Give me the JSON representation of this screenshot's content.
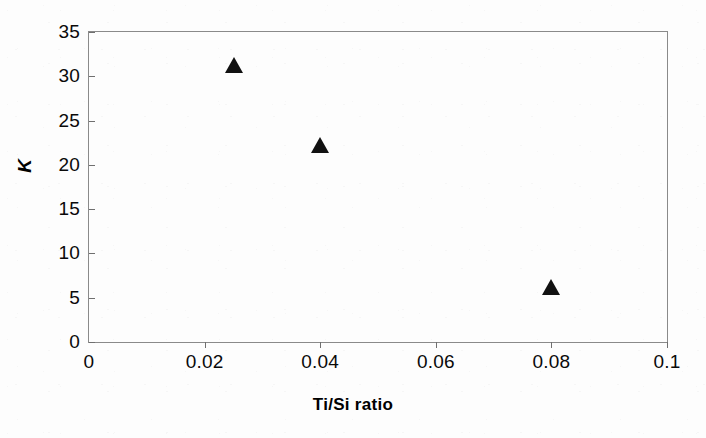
{
  "chart_data": {
    "type": "scatter",
    "title": "",
    "xlabel": "Ti/Si ratio",
    "ylabel": "K",
    "xlim": [
      0,
      0.1
    ],
    "ylim": [
      0,
      35
    ],
    "xticks": [
      "0",
      "0.02",
      "0.04",
      "0.06",
      "0.08",
      "0.1"
    ],
    "xtick_values": [
      0,
      0.02,
      0.04,
      0.06,
      0.08,
      0.1
    ],
    "yticks": [
      "0",
      "5",
      "10",
      "15",
      "20",
      "25",
      "30",
      "35"
    ],
    "ytick_values": [
      0,
      5,
      10,
      15,
      20,
      25,
      30,
      35
    ],
    "grid": false,
    "legend": false,
    "marker": "filled-triangle",
    "marker_color": "#111111",
    "frame_color": "#8a8a8a",
    "background": "#fdfdfd",
    "series": [
      {
        "name": "K vs Ti/Si ratio",
        "x": [
          0.025,
          0.04,
          0.08
        ],
        "y": [
          31,
          22,
          6
        ],
        "points": [
          {
            "x": 0.025,
            "y": 31
          },
          {
            "x": 0.04,
            "y": 22
          },
          {
            "x": 0.08,
            "y": 6
          }
        ]
      }
    ]
  }
}
